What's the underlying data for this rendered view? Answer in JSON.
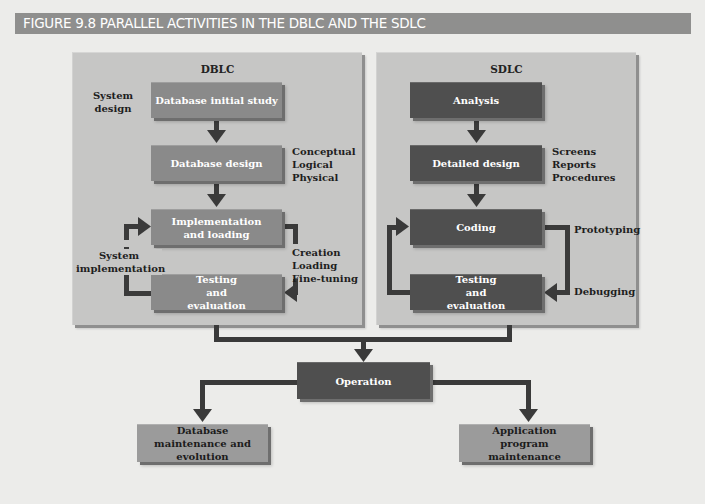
{
  "figure": {
    "title": "FIGURE 9.8  PARALLEL ACTIVITIES IN THE DBLC AND THE SDLC"
  },
  "dblc": {
    "title": "DBLC",
    "boxes": [
      {
        "label": "Database initial study"
      },
      {
        "label": "Database design"
      },
      {
        "label": "Implementation and loading"
      },
      {
        "label": "Testing and evaluation"
      }
    ],
    "annotations": {
      "system_design": "System design",
      "design_levels": [
        "Conceptual",
        "Logical",
        "Physical"
      ],
      "system_implementation": "System implementation",
      "implementation_tasks": [
        "Creation",
        "Loading",
        "Fine-tuning"
      ]
    }
  },
  "sdlc": {
    "title": "SDLC",
    "boxes": [
      {
        "label": "Analysis"
      },
      {
        "label": "Detailed design"
      },
      {
        "label": "Coding"
      },
      {
        "label": "Testing and evaluation"
      }
    ],
    "annotations": {
      "design_outputs": [
        "Screens",
        "Reports",
        "Procedures"
      ],
      "prototyping": "Prototyping",
      "debugging": "Debugging"
    }
  },
  "shared": {
    "operation": "Operation",
    "db_maintenance": "Database maintenance and evolution",
    "app_maintenance": "Application program maintenance"
  },
  "colors": {
    "background": "#ececea",
    "title_bar": "#8f8f8e",
    "panel": "#c6c6c5",
    "dblc_box": "#8a8a8a",
    "sdlc_box": "#4f4f4f",
    "maintenance_box": "#9b9b9b",
    "arrow": "#3a3a3a"
  }
}
